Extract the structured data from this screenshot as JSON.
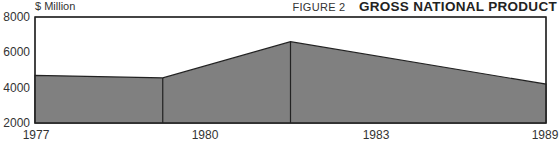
{
  "header": {
    "unit_label": "$ Million",
    "figure_number": "FIGURE 2",
    "figure_title": "GROSS NATIONAL PRODUCT"
  },
  "chart_data": {
    "type": "area",
    "title": "GROSS NATIONAL PRODUCT",
    "figure_label": "FIGURE 2",
    "xlabel": "",
    "ylabel": "$ Million",
    "categories": [
      "1977",
      "1980",
      "1983",
      "1989"
    ],
    "values": [
      4700,
      4550,
      6600,
      4200
    ],
    "ylim": [
      2000,
      8000
    ],
    "yticks": [
      "8000",
      "6000",
      "4000",
      "2000"
    ],
    "xticks": [
      "1977",
      "1980",
      "1983",
      "1989"
    ],
    "grid": false,
    "legend": null,
    "fill_color": "#808080",
    "line_color": "#222222"
  }
}
